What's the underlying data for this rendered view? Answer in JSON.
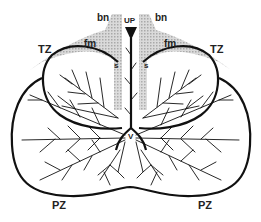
{
  "diagram": {
    "labels": {
      "bn_left": "bn",
      "bn_right": "bn",
      "up": "UP",
      "tz_left": "TZ",
      "tz_right": "TZ",
      "fm_left": "fm",
      "fm_right": "fm",
      "s_left": "s",
      "s_right": "s",
      "v": "V",
      "pz_left": "PZ",
      "pz_right": "PZ"
    },
    "colors": {
      "outline": "#111111",
      "shading": "#b5b5b5",
      "text": "#222222",
      "background": "#ffffff"
    }
  }
}
